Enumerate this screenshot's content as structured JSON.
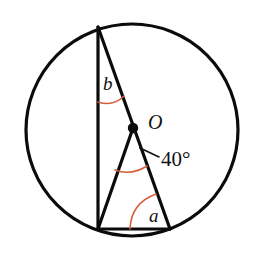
{
  "figure": {
    "type": "geometry-diagram",
    "canvas": {
      "width": 257,
      "height": 254,
      "background": "#ffffff"
    },
    "colors": {
      "stroke": "#0b0b0b",
      "arc_accent": "#D4603A",
      "label": "#111111",
      "background": "#ffffff"
    }
  },
  "circle": {
    "center_label": "O",
    "cx": 132,
    "cy": 130,
    "r": 106,
    "stroke_width": 3.2
  },
  "points": {
    "center": {
      "name": "O",
      "x": 133,
      "y": 128
    },
    "top": {
      "name": "T",
      "x": 98,
      "y": 27
    },
    "bottom_left": {
      "name": "L",
      "x": 98,
      "y": 229
    },
    "bottom_right": {
      "name": "R",
      "x": 170,
      "y": 229
    }
  },
  "segments": [
    {
      "name": "chord-top-to-bottom-left",
      "x1": 98,
      "y1": 27,
      "x2": 98,
      "y2": 229
    },
    {
      "name": "chord-top-to-bottom-right",
      "x1": 98,
      "y1": 27,
      "x2": 170,
      "y2": 229
    },
    {
      "name": "chord-bottom",
      "x1": 98,
      "y1": 229,
      "x2": 170,
      "y2": 229
    },
    {
      "name": "radius-center-to-bottom-left",
      "x1": 133,
      "y1": 128,
      "x2": 98,
      "y2": 229
    }
  ],
  "labels": {
    "center": {
      "text": "O",
      "x": 148,
      "y": 124,
      "size": 20,
      "italic": true
    },
    "angle_b": {
      "text": "b",
      "x": 103,
      "y": 86,
      "size": 19,
      "italic": true
    },
    "angle_a": {
      "text": "a",
      "x": 149,
      "y": 218,
      "size": 19,
      "italic": true
    },
    "angle_center": {
      "text": "40°",
      "x": 161,
      "y": 161,
      "size": 21,
      "italic": false
    }
  },
  "arcs": [
    {
      "name": "arc-angle-b",
      "vertex": "T",
      "color": "#D4603A",
      "stroke_width": 1.5
    },
    {
      "name": "arc-angle-center",
      "vertex": "O",
      "color": "#D4603A",
      "stroke_width": 1.5
    },
    {
      "name": "arc-angle-a",
      "vertex": "R",
      "color": "#D4603A",
      "stroke_width": 1.5
    }
  ],
  "leader": {
    "name": "leader-to-center-angle",
    "from_x": 159,
    "from_y": 157,
    "to_x": 140,
    "to_y": 148
  },
  "chart_data": {
    "type": "table",
    "annotations": [
      {
        "label": "O",
        "meaning": "circle centre",
        "value": ""
      },
      {
        "label": "b",
        "meaning": "inscribed angle at top vertex",
        "value": ""
      },
      {
        "label": "a",
        "meaning": "angle at bottom-right vertex",
        "value": ""
      },
      {
        "label": "40°",
        "meaning": "central angle at O",
        "value": 40
      }
    ]
  }
}
